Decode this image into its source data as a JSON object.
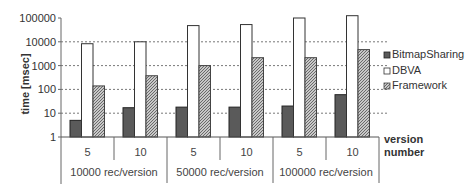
{
  "chart_data": {
    "type": "bar",
    "title": "",
    "xlabel": "version number",
    "ylabel": "time [msec]",
    "yscale": "log",
    "ylim": [
      1,
      100000
    ],
    "yticks": [
      "1",
      "10",
      "100",
      "1000",
      "10000",
      "100000"
    ],
    "grid": true,
    "legend_position": "right",
    "groups": [
      {
        "label": "10000 rec/version",
        "versions": [
          "5",
          "10"
        ]
      },
      {
        "label": "50000 rec/version",
        "versions": [
          "5",
          "10"
        ]
      },
      {
        "label": "100000 rec/version",
        "versions": [
          "5",
          "10"
        ]
      }
    ],
    "categories": [
      "10000/5",
      "10000/10",
      "50000/5",
      "50000/10",
      "100000/5",
      "100000/10"
    ],
    "series": [
      {
        "name": "BitmapSharing",
        "color": "#5a5a5a",
        "pattern": "solid",
        "values": [
          5,
          17,
          18,
          18,
          20,
          60
        ]
      },
      {
        "name": "DBVA",
        "color": "#ffffff",
        "pattern": "none",
        "values": [
          8300,
          10000,
          48000,
          53000,
          100000,
          125000
        ]
      },
      {
        "name": "Framework",
        "color": "#a8a8a8",
        "pattern": "hatched",
        "values": [
          140,
          375,
          1000,
          2150,
          2150,
          4700
        ]
      }
    ]
  },
  "legend": {
    "items": [
      "BitmapSharing",
      "DBVA",
      "Framework"
    ]
  },
  "axis": {
    "ylabel": "time [msec]",
    "xlabel_line1": "version",
    "xlabel_line2": "number"
  }
}
